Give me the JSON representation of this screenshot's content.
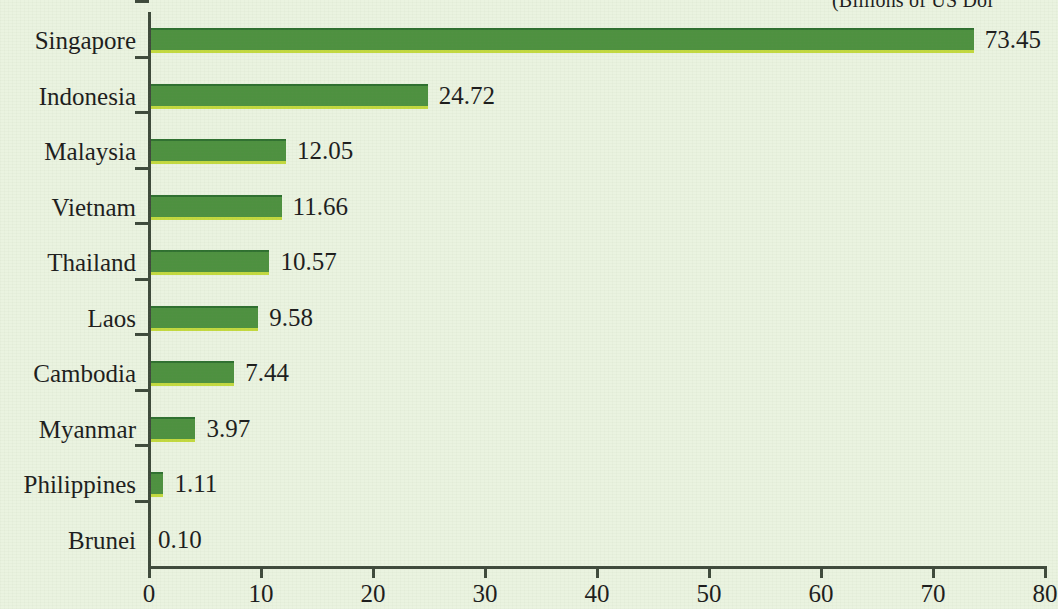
{
  "chart_data": {
    "type": "bar",
    "orientation": "horizontal",
    "title": "(Billions of US Dol",
    "title_note": "title is cropped at the top and right edge of the screenshot",
    "xlabel": "",
    "ylabel": "",
    "categories": [
      "Singapore",
      "Indonesia",
      "Malaysia",
      "Vietnam",
      "Thailand",
      "Laos",
      "Cambodia",
      "Myanmar",
      "Philippines",
      "Brunei"
    ],
    "values": [
      73.45,
      24.72,
      12.05,
      11.66,
      10.57,
      9.58,
      7.44,
      3.97,
      1.11,
      0.1
    ],
    "value_labels": [
      "73.45",
      "24.72",
      "12.05",
      "11.66",
      "10.57",
      "9.58",
      "7.44",
      "3.97",
      "1.11",
      "0.10"
    ],
    "xlim": [
      0,
      80
    ],
    "xticks": [
      0,
      10,
      20,
      30,
      40,
      50,
      60,
      70,
      80
    ],
    "xtick_labels": [
      "0",
      "10",
      "20",
      "30",
      "40",
      "50",
      "60",
      "70",
      "80"
    ],
    "grid": false,
    "legend": null,
    "colors": {
      "background": "#eaf3e0",
      "bar_fill": "#4e9140",
      "bar_top_edge": "#2f7030",
      "bar_bottom_edge": "#c3d93f",
      "axis": "#3f4a3c",
      "text": "#1d1d1d"
    }
  }
}
